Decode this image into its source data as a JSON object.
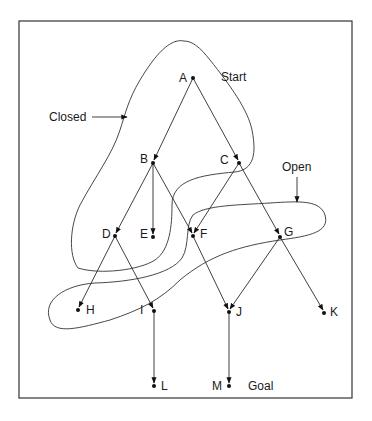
{
  "diagram": {
    "type": "search-tree",
    "region_labels": {
      "closed": "Closed",
      "open": "Open"
    },
    "annotations": {
      "start": "Start",
      "goal": "Goal"
    },
    "nodes": [
      {
        "id": "A",
        "label": "A",
        "x": 193,
        "y": 78
      },
      {
        "id": "B",
        "label": "B",
        "x": 153,
        "y": 163
      },
      {
        "id": "C",
        "label": "C",
        "x": 239,
        "y": 163
      },
      {
        "id": "D",
        "label": "D",
        "x": 115,
        "y": 236
      },
      {
        "id": "E",
        "label": "E",
        "x": 153,
        "y": 237
      },
      {
        "id": "F",
        "label": "F",
        "x": 193,
        "y": 236
      },
      {
        "id": "G",
        "label": "G",
        "x": 280,
        "y": 237
      },
      {
        "id": "H",
        "label": "H",
        "x": 78,
        "y": 310
      },
      {
        "id": "I",
        "label": "I",
        "x": 154,
        "y": 311
      },
      {
        "id": "J",
        "label": "J",
        "x": 229,
        "y": 312
      },
      {
        "id": "K",
        "label": "K",
        "x": 324,
        "y": 313
      },
      {
        "id": "L",
        "label": "L",
        "x": 154,
        "y": 386
      },
      {
        "id": "M",
        "label": "M",
        "x": 229,
        "y": 386
      }
    ],
    "edges": [
      [
        "A",
        "B"
      ],
      [
        "A",
        "C"
      ],
      [
        "B",
        "D"
      ],
      [
        "B",
        "E"
      ],
      [
        "B",
        "F"
      ],
      [
        "C",
        "F"
      ],
      [
        "C",
        "G"
      ],
      [
        "D",
        "H"
      ],
      [
        "D",
        "I"
      ],
      [
        "F",
        "J"
      ],
      [
        "G",
        "J"
      ],
      [
        "G",
        "K"
      ],
      [
        "I",
        "L"
      ],
      [
        "J",
        "M"
      ]
    ],
    "closed_set": [
      "A",
      "B",
      "C",
      "D",
      "E"
    ],
    "open_set": [
      "F",
      "G",
      "H",
      "I"
    ]
  }
}
